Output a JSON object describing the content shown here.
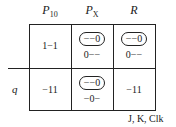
{
  "columns": [
    {
      "label": "P",
      "sub": "10"
    },
    {
      "label": "P",
      "sub": "X"
    },
    {
      "label": "R",
      "sub": ""
    }
  ],
  "row_label": "q",
  "cells": [
    {
      "oval": "",
      "text": "1−1"
    },
    {
      "oval": "−−0",
      "text": "0−−"
    },
    {
      "oval": "−−0",
      "text": "0−−"
    },
    {
      "oval": "",
      "text": "−11"
    },
    {
      "oval": "−−0",
      "text": "−0−"
    },
    {
      "oval": "",
      "text": "−11"
    }
  ],
  "footer": "J, K, Clk"
}
